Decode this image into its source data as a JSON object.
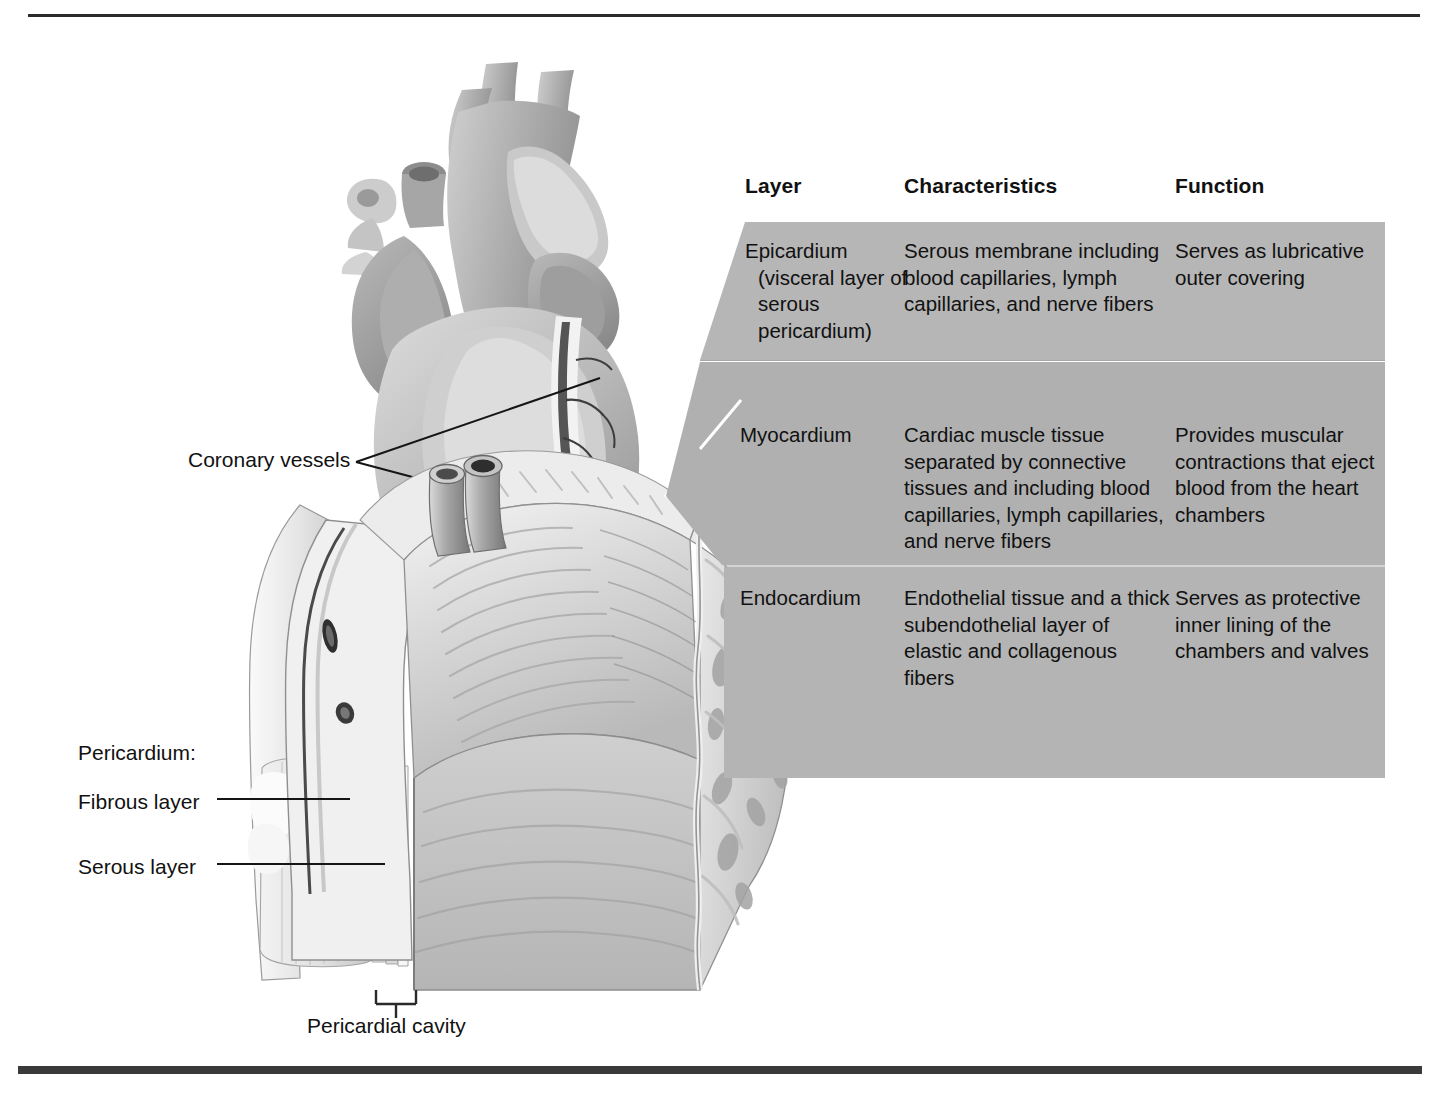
{
  "figure": {
    "colors": {
      "rule": "#2b2b2b",
      "rule_bottom": "#3a3a3a",
      "band_epicardium": "#b6b6b6",
      "band_myocardium": "#b0b0b0",
      "band_endocardium": "#b4b4b4",
      "text": "#111111",
      "leader": "#1a1a1a"
    }
  },
  "table": {
    "headers": [
      "Layer",
      "Characteristics",
      "Function"
    ],
    "rows": [
      {
        "layer": "Epicardium (visceral layer of serous pericardium)",
        "characteristics": "Serous membrane including blood capillaries, lymph capillaries, and nerve fibers",
        "function": "Serves as lubricative outer covering"
      },
      {
        "layer": "Myocardium",
        "characteristics": "Cardiac muscle tissue separated by connective tissues and including blood capillaries, lymph capillaries, and nerve fibers",
        "function": "Provides muscular contractions that eject blood from the heart chambers"
      },
      {
        "layer": "Endocardium",
        "characteristics": "Endothelial tissue and a thick subendothelial layer of elastic and collagenous fibers",
        "function": "Serves as protective inner lining of the chambers and valves"
      }
    ]
  },
  "labels": {
    "coronary_vessels": "Coronary vessels",
    "pericardium": "Pericardium:",
    "fibrous_layer": "Fibrous layer",
    "serous_layer": "Serous layer",
    "pericardial_cavity": "Pericardial cavity"
  }
}
